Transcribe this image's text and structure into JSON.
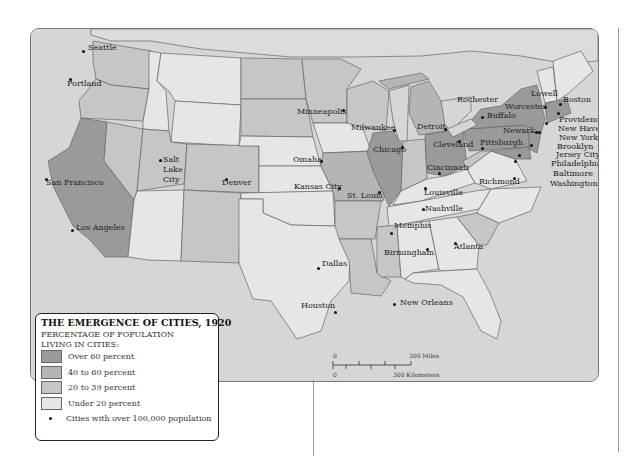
{
  "legend": {
    "title": "THE EMERGENCE OF CITIES, 1920",
    "subtitle_line1": "PERCENTAGE OF POPULATION",
    "subtitle_line2": "LIVING IN CITIES:",
    "items": [
      {
        "label": "Over 60 percent",
        "color": "#9a9a9a"
      },
      {
        "label": "40 to 60 percent",
        "color": "#b5b5b5"
      },
      {
        "label": "20 to 39 percent",
        "color": "#c6c6c6"
      },
      {
        "label": "Under 20 percent",
        "color": "#e6e6e6"
      }
    ],
    "dot_label": "Cities with over 100,000 population"
  },
  "scale": {
    "zero_top": "0",
    "zero_bottom": "0",
    "miles": "300 Miles",
    "kilometers": "300 Kilometers"
  },
  "colors": {
    "water": "#d6d6d6",
    "over60": "#9a9a9a",
    "from40to60": "#b5b5b5",
    "from20to39": "#c6c6c6",
    "under20": "#e6e6e6",
    "border": "#666666"
  },
  "cities": [
    {
      "name": "Seattle",
      "dot": [
        82,
        50
      ],
      "label": [
        87,
        46
      ]
    },
    {
      "name": "Portland",
      "dot": [
        69,
        78
      ],
      "label": [
        66,
        82
      ]
    },
    {
      "name": "San Francisco",
      "dot": [
        45,
        178
      ],
      "label": [
        45,
        181
      ]
    },
    {
      "name": "Los Angeles",
      "dot": [
        71,
        229
      ],
      "label": [
        75,
        226
      ]
    },
    {
      "name": "Salt",
      "dot": [
        159,
        159
      ],
      "label": [
        162,
        158
      ]
    },
    {
      "name": "Lake",
      "dot": null,
      "label": [
        162,
        168
      ]
    },
    {
      "name": "City",
      "dot": null,
      "label": [
        162,
        178
      ]
    },
    {
      "name": "Denver",
      "dot": [
        225,
        178
      ],
      "label": [
        221,
        181
      ]
    },
    {
      "name": "Minneapolis",
      "dot": [
        342,
        109
      ],
      "label": [
        296,
        110
      ]
    },
    {
      "name": "Milwaukee",
      "dot": [
        393,
        129
      ],
      "label": [
        350,
        126
      ]
    },
    {
      "name": "Chicago",
      "dot": [
        401,
        146
      ],
      "label": [
        372,
        148
      ]
    },
    {
      "name": "Detroit",
      "dot": [
        444,
        128
      ],
      "label": [
        416,
        125
      ]
    },
    {
      "name": "Omaha",
      "dot": [
        320,
        160
      ],
      "label": [
        292,
        158
      ]
    },
    {
      "name": "Kansas City",
      "dot": [
        338,
        187
      ],
      "label": [
        293,
        185
      ]
    },
    {
      "name": "St. Louis",
      "dot": [
        378,
        191
      ],
      "label": [
        346,
        194
      ]
    },
    {
      "name": "Cleveland",
      "dot": [
        458,
        140
      ],
      "label": [
        432,
        143
      ]
    },
    {
      "name": "Cincinnati",
      "dot": [
        438,
        172
      ],
      "label": [
        426,
        166
      ]
    },
    {
      "name": "Louisville",
      "dot": [
        424,
        187
      ],
      "label": [
        423,
        191
      ]
    },
    {
      "name": "Nashville",
      "dot": [
        422,
        208
      ],
      "label": [
        424,
        207
      ]
    },
    {
      "name": "Memphis",
      "dot": [
        390,
        232
      ],
      "label": [
        393,
        224
      ]
    },
    {
      "name": "Birmingham",
      "dot": [
        426,
        248
      ],
      "label": [
        383,
        251
      ]
    },
    {
      "name": "Atlanta",
      "dot": [
        454,
        242
      ],
      "label": [
        453,
        245
      ]
    },
    {
      "name": "Dallas",
      "dot": [
        317,
        267
      ],
      "label": [
        321,
        262
      ]
    },
    {
      "name": "Houston",
      "dot": [
        334,
        311
      ],
      "label": [
        300,
        304
      ]
    },
    {
      "name": "New Orleans",
      "dot": [
        393,
        303
      ],
      "label": [
        399,
        301
      ]
    },
    {
      "name": "Rochester",
      "dot": null,
      "label": [
        456,
        98
      ]
    },
    {
      "name": "Buffalo",
      "dot": [
        481,
        116
      ],
      "label": [
        486,
        114
      ]
    },
    {
      "name": "Worcester",
      "dot": [
        544,
        106
      ],
      "label": [
        504,
        105
      ]
    },
    {
      "name": "Lowell",
      "dot": null,
      "label": [
        530,
        92
      ]
    },
    {
      "name": "Boston",
      "dot": [
        559,
        103
      ],
      "label": [
        562,
        98
      ]
    },
    {
      "name": "Providence",
      "dot": [
        557,
        112
      ],
      "label": [
        558,
        118
      ]
    },
    {
      "name": "New Haven",
      "dot": [
        545,
        122
      ],
      "label": [
        557,
        127
      ]
    },
    {
      "name": "New York",
      "dot": [
        538,
        131
      ],
      "label": [
        558,
        136
      ]
    },
    {
      "name": "Newark",
      "dot": [
        535,
        131
      ],
      "label": [
        502,
        129
      ]
    },
    {
      "name": "Brooklyn",
      "dot": null,
      "label": [
        556,
        145
      ]
    },
    {
      "name": "Jersey City",
      "dot": null,
      "label": [
        555,
        153
      ]
    },
    {
      "name": "Pittsburgh",
      "dot": [
        481,
        147
      ],
      "label": [
        479,
        141
      ]
    },
    {
      "name": "Philadelphia",
      "dot": [
        530,
        144
      ],
      "label": [
        550,
        162
      ]
    },
    {
      "name": "Baltimore",
      "dot": [
        518,
        154
      ],
      "label": [
        552,
        172
      ]
    },
    {
      "name": "Washington",
      "dot": [
        514,
        160
      ],
      "label": [
        549,
        182
      ]
    },
    {
      "name": "Richmond",
      "dot": [
        513,
        177
      ],
      "label": [
        478,
        180
      ]
    }
  ]
}
